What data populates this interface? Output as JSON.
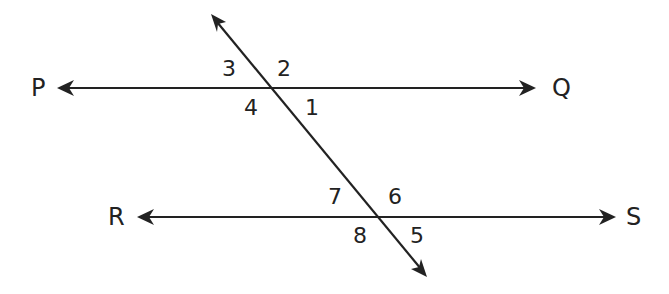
{
  "diagram": {
    "type": "parallel-lines-cut-by-transversal",
    "lines": [
      {
        "name": "PQ",
        "start_label": "P",
        "end_label": "Q"
      },
      {
        "name": "RS",
        "start_label": "R",
        "end_label": "S"
      },
      {
        "name": "transversal"
      }
    ],
    "point_labels": {
      "P": "P",
      "Q": "Q",
      "R": "R",
      "S": "S"
    },
    "angles": {
      "a1": "1",
      "a2": "2",
      "a3": "3",
      "a4": "4",
      "a5": "5",
      "a6": "6",
      "a7": "7",
      "a8": "8"
    },
    "colors": {
      "stroke": "#222222",
      "background": "#ffffff"
    }
  }
}
